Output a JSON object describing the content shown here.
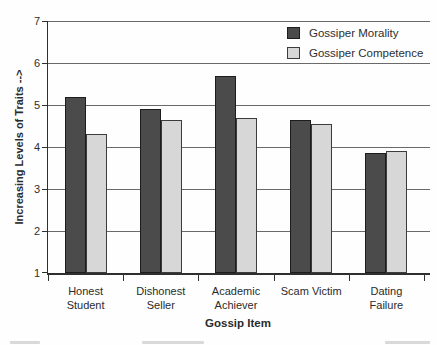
{
  "chart_data": {
    "type": "bar",
    "title": "",
    "categories": [
      "Honest Student",
      "Dishonest Seller",
      "Academic Achiever",
      "Scam Victim",
      "Dating Failure"
    ],
    "series": [
      {
        "name": "Gossiper Morality",
        "color": "#4b4b4b",
        "border": "#1d1d1d",
        "values": [
          5.2,
          4.9,
          5.7,
          4.65,
          3.85
        ]
      },
      {
        "name": "Gossiper Competence",
        "color": "#d7d7d7",
        "border": "#3c3c3c",
        "values": [
          4.3,
          4.65,
          4.7,
          4.55,
          3.9
        ]
      }
    ],
    "xlabel": "Gossip Item",
    "ylabel": "Increasing Levels of Traits -->",
    "ylim": [
      1,
      7
    ],
    "yticks": [
      1,
      2,
      3,
      4,
      5,
      6,
      7
    ],
    "grid": true,
    "legend_position": "top-right"
  }
}
